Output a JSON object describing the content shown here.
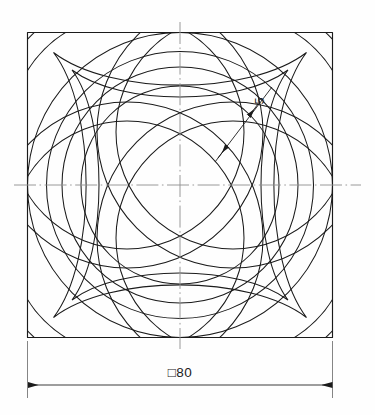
{
  "drawing": {
    "title": "Interlaced four-band rosette in square plate",
    "type": "engineering-part-drawing",
    "background_color": "#fefefe",
    "line_color": "#1b1b1b",
    "centerline_color": "#8e8e8e",
    "units": "mm",
    "projection": "front view"
  },
  "dimensions": [
    {
      "id": "overall-square",
      "label": "□80",
      "symbol": "□",
      "value": 80,
      "kind": "square-across-flats",
      "placement": "below",
      "arrow_style": "filled-closed"
    },
    {
      "id": "band-width",
      "label": "5",
      "value": 5,
      "kind": "band-width",
      "placement": "leader-upper-right",
      "arrow_style": "filled-closed",
      "text_rotation_deg": 90
    }
  ],
  "geometry": {
    "square": {
      "x": 27.5,
      "y": 32.5,
      "size": 305,
      "corner_style": "sharp"
    },
    "center": {
      "x": 180,
      "y": 185
    },
    "outer_circle_radius": 152.5,
    "inner_circle_radius": 118,
    "band_width_px": 19,
    "band_count": 4,
    "band_centre_radius": 108,
    "band_offset": 74,
    "weave": "over-under alternating"
  },
  "centerlines": {
    "horizontal": {
      "x1": 14,
      "y1": 185,
      "x2": 361,
      "y2": 185
    },
    "vertical": {
      "x1": 180,
      "y1": 22,
      "x2": 180,
      "y2": 349
    }
  },
  "dimension_lines": {
    "bottom": {
      "y": 385,
      "x_left": 28,
      "x_right": 333,
      "ext_top": 341,
      "ext_bottom": 398,
      "text_x": 180,
      "text_y": 378
    },
    "band_leader": {
      "x1": 218,
      "y1": 158,
      "x2": 268,
      "y2": 92,
      "arrow1_x": 227,
      "arrow1_y": 146,
      "arrow2_x": 249,
      "arrow2_y": 117,
      "text_x": 262,
      "text_y": 100
    }
  }
}
